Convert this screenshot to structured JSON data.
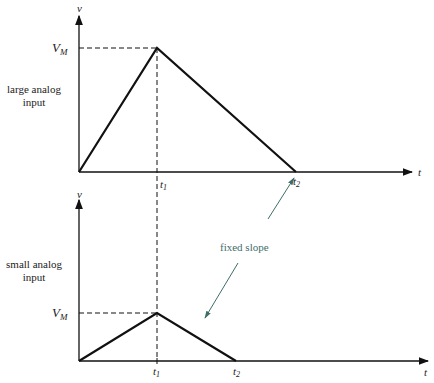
{
  "diagram": {
    "top_panel": {
      "side_label_line1": "large analog",
      "side_label_line2": "input",
      "y_axis_label": "v",
      "x_axis_label": "t",
      "peak_label": "V",
      "peak_label_sub": "M",
      "t1_label": "t",
      "t1_sub": "1",
      "t2_label": "t",
      "t2_sub": "2"
    },
    "bottom_panel": {
      "side_label_line1": "small analog",
      "side_label_line2": "input",
      "y_axis_label": "v",
      "x_axis_label": "t",
      "peak_label": "V",
      "peak_label_sub": "M",
      "t1_label": "t",
      "t1_sub": "1",
      "t2_label": "t",
      "t2_sub": "2"
    },
    "annotation": {
      "text": "fixed slope",
      "color": "#3f6e6a"
    },
    "line_color": "#111111"
  }
}
